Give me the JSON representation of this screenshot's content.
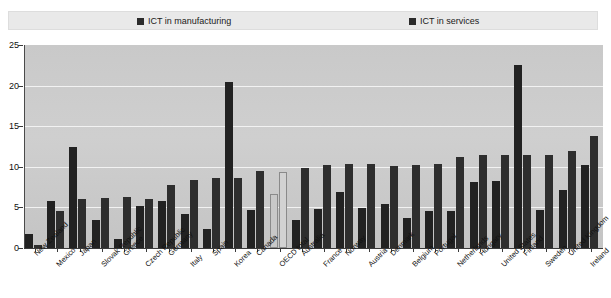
{
  "legend": {
    "entries": [
      {
        "label": "ICT in manufacturing",
        "color": "#222222",
        "icon": "square-marker-icon"
      },
      {
        "label": "ICT in services",
        "color": "#2e2e2e",
        "icon": "square-marker-icon"
      }
    ]
  },
  "axis": {
    "y_ticks": [
      "0",
      "5",
      "10",
      "15",
      "20",
      "25"
    ]
  },
  "chart_data": {
    "type": "bar",
    "title": "",
    "xlabel": "",
    "ylabel": "",
    "ylim": [
      0,
      25
    ],
    "ytick_step": 5,
    "grid": true,
    "legend_position": "top",
    "categories": [
      "New Zealand",
      "Mexico",
      "Japan",
      "Slovak Republic",
      "Greece",
      "Czech Republic",
      "Germany",
      "Italy",
      "Spain",
      "Korea",
      "Canada",
      "OECD total",
      "Australia",
      "France",
      "Norway",
      "Austria",
      "Denmark",
      "Belgium",
      "Portugal",
      "Netherlands",
      "Hungary",
      "United States",
      "Finland",
      "Sweden",
      "United Kingdom",
      "Ireland"
    ],
    "highlight_category": "OECD total",
    "series": [
      {
        "name": "ICT in manufacturing",
        "color": "#222222",
        "values": [
          1.7,
          5.8,
          12.5,
          3.4,
          1.1,
          5.2,
          5.8,
          4.2,
          2.3,
          20.5,
          4.7,
          6.6,
          3.5,
          4.8,
          6.9,
          4.9,
          5.4,
          3.7,
          4.5,
          4.5,
          8.1,
          8.3,
          22.5,
          4.7,
          7.2,
          10.2
        ]
      },
      {
        "name": "ICT in services",
        "color": "#2e2e2e",
        "values": [
          0.4,
          4.6,
          6.0,
          6.2,
          6.3,
          6.0,
          7.8,
          8.4,
          8.6,
          8.6,
          9.5,
          9.3,
          9.8,
          10.2,
          10.4,
          10.4,
          10.1,
          10.2,
          10.4,
          11.2,
          11.5,
          11.5,
          11.5,
          11.5,
          11.9,
          13.8
        ]
      }
    ]
  }
}
